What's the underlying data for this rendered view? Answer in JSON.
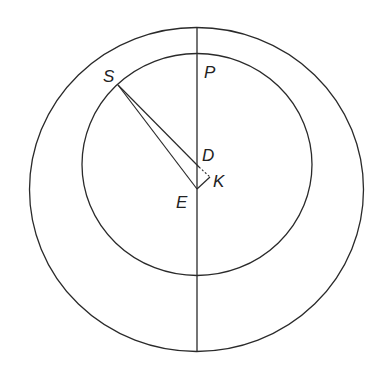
{
  "diagram": {
    "colors": {
      "stroke": "#2a2a2a",
      "background": "#ffffff",
      "text": "#222222"
    },
    "outer_circle": {
      "cx": 196.5,
      "cy": 189.5,
      "rx": 167,
      "ry": 162
    },
    "inner_circle": {
      "cx": 197,
      "cy": 164.5,
      "rx": 115,
      "ry": 111
    },
    "vertical_line": {
      "x": 197,
      "y1": 27,
      "y2": 352
    },
    "points": {
      "S": {
        "x": 118,
        "y": 85
      },
      "P": {
        "x": 197,
        "y": 54
      },
      "D": {
        "x": 197,
        "y": 166
      },
      "K": {
        "x": 210,
        "y": 178
      },
      "E": {
        "x": 197,
        "y": 189
      }
    },
    "labels": {
      "S": "S",
      "P": "P",
      "D": "D",
      "K": "K",
      "E": "E"
    }
  }
}
